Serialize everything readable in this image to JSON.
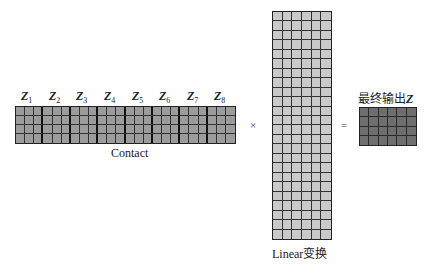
{
  "diagram": {
    "concat": {
      "blocks": [
        {
          "symbol": "Z",
          "index": "1"
        },
        {
          "symbol": "Z",
          "index": "2"
        },
        {
          "symbol": "Z",
          "index": "3"
        },
        {
          "symbol": "Z",
          "index": "4"
        },
        {
          "symbol": "Z",
          "index": "5"
        },
        {
          "symbol": "Z",
          "index": "6"
        },
        {
          "symbol": "Z",
          "index": "7"
        },
        {
          "symbol": "Z",
          "index": "8"
        }
      ],
      "block_cols": 3,
      "rows": 4,
      "caption": "Contact",
      "fill_color": "#9c9c9c"
    },
    "multiply_symbol": "×",
    "linear": {
      "cols": 6,
      "rows": 24,
      "caption": "Linear变换",
      "fill_color": "#c9c9c9"
    },
    "equals_symbol": "=",
    "output": {
      "cols": 6,
      "rows": 4,
      "caption_prefix": "最终输出",
      "caption_symbol": "Z",
      "fill_color": "#6e6e6e"
    }
  }
}
